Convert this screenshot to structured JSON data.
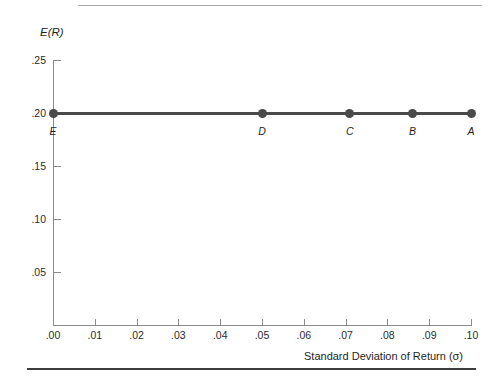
{
  "chart_data": {
    "type": "line",
    "title": "",
    "xlabel": "Standard Deviation of Return (σ)",
    "ylabel": "E(R)",
    "xlim": [
      0.0,
      0.1
    ],
    "ylim": [
      0.0,
      0.25
    ],
    "grid": false,
    "legend": "none",
    "xticks": [
      ".00",
      ".01",
      ".02",
      ".03",
      ".04",
      ".05",
      ".06",
      ".07",
      ".08",
      ".09",
      ".10"
    ],
    "xtick_values": [
      0.0,
      0.01,
      0.02,
      0.03,
      0.04,
      0.05,
      0.06,
      0.07,
      0.08,
      0.09,
      0.1
    ],
    "yticks": [
      ".05",
      ".10",
      ".15",
      ".20",
      ".25"
    ],
    "ytick_values": [
      0.05,
      0.1,
      0.15,
      0.2,
      0.25
    ],
    "series": [
      {
        "name": "",
        "x": [
          0.0,
          0.05,
          0.071,
          0.086,
          0.1
        ],
        "y": [
          0.2,
          0.2,
          0.2,
          0.2,
          0.2
        ],
        "point_labels": [
          "E",
          "D",
          "C",
          "B",
          "A"
        ],
        "color": "#4a4a4a"
      }
    ]
  },
  "colors": {
    "series": "#4a4a4a",
    "axis": "#8a8a8a",
    "text": "#1f1f1f",
    "rule_top": "#a8a8a8",
    "rule_bottom": "#3d3d3d",
    "background": "#ffffff"
  }
}
